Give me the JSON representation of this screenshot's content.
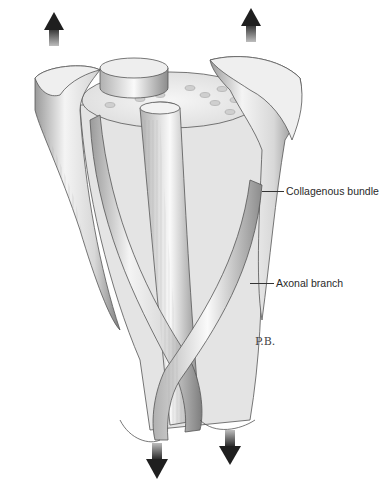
{
  "figure": {
    "labels": [
      {
        "id": "collagenous",
        "text": "Collagenous bundle"
      },
      {
        "id": "axonal",
        "text": "Axonal branch"
      }
    ],
    "signature": "P.B.",
    "arrows": {
      "top": [
        "up-arrow",
        "up-arrow"
      ],
      "bottom": [
        "down-arrow",
        "down-arrow"
      ]
    },
    "colors": {
      "background": "#ffffff",
      "ink": "#2a2a2a",
      "shade_light": "#f2f2f2",
      "shade_mid": "#cfcfcf",
      "shade_dark": "#8a8a8a"
    }
  }
}
